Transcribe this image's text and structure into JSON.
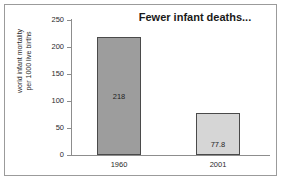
{
  "chart_data": {
    "type": "bar",
    "title": "Fewer infant deaths...",
    "xlabel": "",
    "ylabel": "world infant mortality per 1000 live births",
    "ylabel_line1": "world infant mortality",
    "ylabel_line2": "per 1000 live births",
    "categories": [
      "1960",
      "2001"
    ],
    "values": [
      218,
      77.8
    ],
    "value_labels": [
      "218",
      "77.8"
    ],
    "bar_colors": [
      "#9d9d9d",
      "#d6d6d6"
    ],
    "bar_edge_color": "#4a4a4a",
    "ylim": [
      0,
      250
    ],
    "yticks": [
      0,
      50,
      100,
      150,
      200,
      250
    ],
    "ytick_labels": [
      "0",
      "50",
      "100",
      "150",
      "200",
      "250"
    ],
    "grid": false,
    "legend": "none",
    "frame_color": "#9b9b9b",
    "axis_color": "#8d8d8d",
    "background": "#ffffff"
  }
}
